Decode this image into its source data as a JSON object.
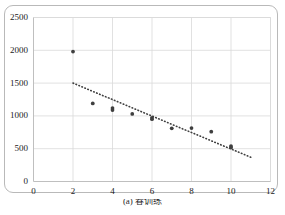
{
  "figure": {
    "caption": "(a) 春训练"
  },
  "chart_data": {
    "type": "scatter",
    "title": "",
    "xlabel": "",
    "ylabel": "",
    "xlim": [
      0,
      12
    ],
    "ylim": [
      0,
      2500
    ],
    "xticks": [
      0,
      2,
      4,
      6,
      8,
      10,
      12
    ],
    "yticks": [
      0,
      500,
      1000,
      1500,
      2000,
      2500
    ],
    "xtick_labels": [
      "0",
      "2",
      "4",
      "6",
      "8",
      "10",
      "12"
    ],
    "ytick_labels": [
      "0",
      "500",
      "1000",
      "1500",
      "2000",
      "2500"
    ],
    "grid": true,
    "legend": false,
    "series": [
      {
        "name": "observations",
        "type": "scatter",
        "marker": "circle",
        "color": "#3f3f3f",
        "points": [
          [
            2,
            1980
          ],
          [
            3,
            1190
          ],
          [
            4,
            1120
          ],
          [
            4,
            1090
          ],
          [
            5,
            1030
          ],
          [
            6,
            970
          ],
          [
            6,
            950
          ],
          [
            7,
            810
          ],
          [
            8,
            815
          ],
          [
            9,
            760
          ],
          [
            10,
            540
          ],
          [
            10,
            520
          ]
        ]
      },
      {
        "name": "trendline",
        "type": "line",
        "style": "dotted",
        "color": "#3f3f3f",
        "points": [
          [
            2,
            1500
          ],
          [
            11,
            370
          ]
        ]
      }
    ],
    "colors": {
      "marker": "#3f3f3f",
      "trendline": "#3f3f3f",
      "grid": "#d9d9d9",
      "axis": "#bfbfbf",
      "text": "#1b1b1b",
      "card_border": "#b9b9b9",
      "background": "#ffffff"
    }
  }
}
